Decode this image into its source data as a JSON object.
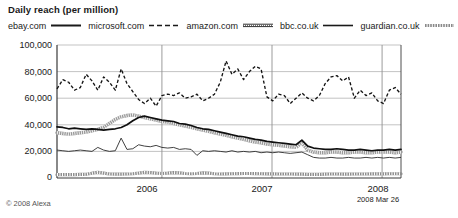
{
  "header": {
    "title": "Daily reach (per million)"
  },
  "legend": {
    "position": "top",
    "items": [
      {
        "label": "ebay.com",
        "style": "solid-black",
        "color": "#1a1a1a"
      },
      {
        "label": "microsoft.com",
        "style": "dashed",
        "color": "#1a1a1a"
      },
      {
        "label": "amazon.com",
        "style": "double-thin",
        "color": "#1a1a1a"
      },
      {
        "label": "bbc.co.uk",
        "style": "solid-thin",
        "color": "#1a1a1a"
      },
      {
        "label": "guardian.co.uk",
        "style": "hatched",
        "color": "#7a7a7a"
      }
    ]
  },
  "footer": {
    "credit": "© 2008 Alexa",
    "as_of": "2008 Mar 26"
  },
  "axes": {
    "y_ticks": [
      "100,000",
      "80,000",
      "60,000",
      "40,000",
      "20,000",
      "0"
    ],
    "x_ticks": [
      "2006",
      "2007",
      "2008"
    ]
  },
  "chart_data": {
    "type": "line",
    "title": "Daily reach (per million)",
    "xlabel": "",
    "ylabel": "Daily reach (per million)",
    "ylim": [
      0,
      100000
    ],
    "ytick_values": [
      0,
      20000,
      40000,
      60000,
      80000,
      100000
    ],
    "xlim": [
      "2005-05",
      "2008-03-26"
    ],
    "xtick_labels": [
      "2006",
      "2007",
      "2008"
    ],
    "xtick_positions": [
      0.305,
      0.625,
      0.945
    ],
    "grid": "horizontal-and-vertical",
    "legend_position": "top",
    "as_of": "2008 Mar 26",
    "source": "© 2008 Alexa",
    "n_points": 60,
    "series": [
      {
        "name": "ebay.com",
        "style": "solid-black",
        "values": [
          38500,
          38000,
          37000,
          37500,
          37000,
          36500,
          37000,
          36500,
          36000,
          36500,
          37000,
          38000,
          40000,
          43000,
          45500,
          46500,
          45500,
          44500,
          43500,
          43000,
          42500,
          41000,
          40500,
          39500,
          38000,
          37000,
          36500,
          35500,
          34500,
          33500,
          32500,
          31500,
          31000,
          30000,
          29000,
          28500,
          27500,
          27000,
          26500,
          26000,
          25500,
          25000,
          28500,
          24000,
          22500,
          22000,
          21500,
          21500,
          22000,
          21500,
          21000,
          21000,
          21500,
          21000,
          20500,
          21000,
          21000,
          21500,
          21000,
          21500
        ]
      },
      {
        "name": "microsoft.com",
        "style": "thick-gray",
        "values": [
          34000,
          33500,
          33000,
          33500,
          34000,
          34500,
          35500,
          36500,
          38000,
          41000,
          44000,
          46000,
          47000,
          47500,
          46500,
          45500,
          44500,
          43500,
          42500,
          42000,
          41000,
          40000,
          39000,
          38000,
          37000,
          36000,
          35000,
          34000,
          33000,
          32000,
          31000,
          30000,
          29000,
          28000,
          27000,
          26500,
          25500,
          25000,
          24500,
          24000,
          23500,
          23000,
          26500,
          21000,
          19500,
          19000,
          19000,
          19500,
          19500,
          19000,
          19000,
          19500,
          19500,
          19000,
          19000,
          19500,
          19500,
          19500,
          19000,
          19500
        ]
      },
      {
        "name": "amazon.com",
        "style": "dashed",
        "values": [
          67000,
          74000,
          72000,
          66000,
          68000,
          78000,
          73000,
          66000,
          76000,
          72000,
          66000,
          82000,
          71000,
          65000,
          59000,
          56000,
          60000,
          54000,
          62000,
          63000,
          62000,
          64000,
          60000,
          61000,
          63000,
          58000,
          60000,
          63000,
          72000,
          88000,
          78000,
          82000,
          74000,
          80000,
          84000,
          82000,
          61000,
          58000,
          63000,
          62000,
          56000,
          60000,
          64000,
          60000,
          58000,
          62000,
          71000,
          76000,
          77000,
          73000,
          76000,
          60000,
          66000,
          62000,
          64000,
          58000,
          56000,
          66000,
          68000,
          63000
        ]
      },
      {
        "name": "bbc.co.uk",
        "style": "solid-thin",
        "values": [
          21000,
          20500,
          20000,
          20500,
          21000,
          20500,
          20000,
          23000,
          21000,
          20000,
          20500,
          30000,
          21500,
          22000,
          25000,
          24000,
          23500,
          24500,
          23000,
          22500,
          23000,
          21500,
          22000,
          21500,
          17000,
          20500,
          20000,
          20500,
          20000,
          19500,
          20500,
          19500,
          20000,
          19500,
          20000,
          19000,
          19500,
          19000,
          19500,
          19000,
          18500,
          19000,
          19500,
          17500,
          15500,
          15000,
          15000,
          15500,
          15000,
          15000,
          15500,
          15000,
          15000,
          15500,
          15000,
          15500,
          15000,
          15500,
          15000,
          15500
        ]
      },
      {
        "name": "guardian.co.uk",
        "style": "hatched",
        "values": [
          2500,
          2500,
          2600,
          2600,
          2700,
          2800,
          3600,
          4200,
          3600,
          3000,
          2900,
          2900,
          3000,
          3200,
          3600,
          4200,
          4000,
          3600,
          3400,
          3600,
          4000,
          3800,
          3400,
          3200,
          3400,
          3800,
          3600,
          3200,
          3000,
          3100,
          3200,
          3300,
          3400,
          3400,
          3300,
          3200,
          3100,
          3100,
          3000,
          3000,
          3000,
          2900,
          2900,
          2800,
          2800,
          2800,
          2900,
          3000,
          3000,
          2900,
          2900,
          3000,
          3000,
          3000,
          3100,
          3100,
          3100,
          3200,
          3200,
          3200
        ]
      }
    ]
  }
}
